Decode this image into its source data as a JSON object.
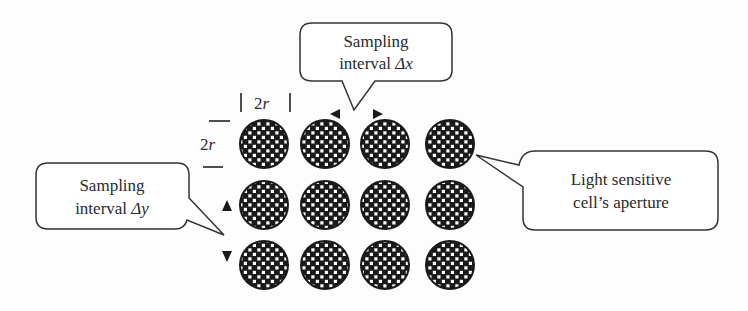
{
  "figure": {
    "grid": {
      "rows": 3,
      "cols": 4,
      "col_centers": [
        264,
        325,
        385,
        450
      ],
      "row_centers": [
        144,
        205,
        265
      ],
      "radius": 24
    },
    "dimension_labels": {
      "width": "2r",
      "height": "2r"
    },
    "callouts": {
      "dx": {
        "line1": "Sampling",
        "line2_prefix": "interval ",
        "line2_symbol": "Δx"
      },
      "dy": {
        "line1": "Sampling",
        "line2_prefix": "interval ",
        "line2_symbol": "Δy"
      },
      "aperture": {
        "line1": "Light sensitive",
        "line2": "cell’s aperture"
      }
    },
    "colors": {
      "ink": "#1a1a1a",
      "stroke": "#333333",
      "bg": "#fdfdfd"
    }
  }
}
